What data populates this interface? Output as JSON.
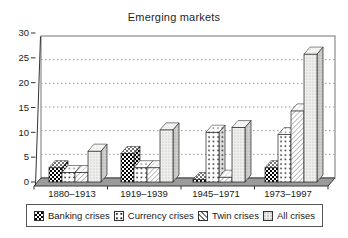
{
  "chart_data": {
    "type": "bar",
    "style": "3d-grayscale-hatched",
    "title": "Emerging markets",
    "categories": [
      "1880–1913",
      "1919–1939",
      "1945–1971",
      "1973–1997"
    ],
    "series": [
      {
        "name": "Banking crises",
        "pattern": "dark-checker",
        "values": [
          3,
          6,
          0.5,
          3
        ]
      },
      {
        "name": "Currency crises",
        "pattern": "sparse-dots",
        "values": [
          2,
          3,
          10.5,
          10
        ]
      },
      {
        "name": "Twin crises",
        "pattern": "diagonal-hatch",
        "values": [
          2,
          3,
          1,
          15
        ]
      },
      {
        "name": "All crises",
        "pattern": "fine-dots-gray",
        "values": [
          6.5,
          11,
          11.5,
          27
        ]
      }
    ],
    "xlabel": "",
    "ylabel": "",
    "ylim": [
      0,
      30
    ],
    "yticks": [
      0,
      5,
      10,
      15,
      20,
      25,
      30
    ],
    "grid": "horizontal-dotted",
    "legend_position": "bottom-boxed"
  },
  "colors": {
    "background": "#ffffff",
    "text": "#1a1a1a",
    "axis": "#333333",
    "wall_border": "#777777",
    "gridline": "#999999",
    "floor_fill": "#9b9b9b",
    "floor_border": "#3a3a3a",
    "bar_outline": "#222222",
    "legend_border": "#555555"
  }
}
